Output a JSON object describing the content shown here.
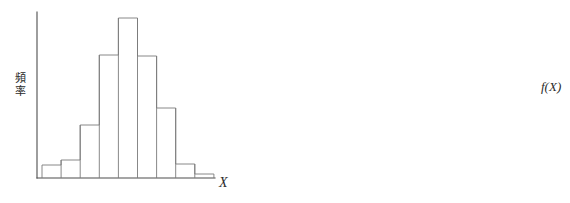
{
  "figure": {
    "title": "",
    "background_color": "#ffffff",
    "width": 570,
    "height": 203
  },
  "panels": [
    {
      "id": "left",
      "name": "sample-histogram",
      "y_axis_label": "頻\n率",
      "y_axis_label_chars": [
        "頻",
        "率"
      ],
      "x_axis_label": "X"
    },
    {
      "id": "right",
      "name": "density-histogram",
      "y_axis_label": "f(X)",
      "x_axis_label": "X"
    }
  ],
  "colors": {
    "axis": "#4d4d4d",
    "bar_stroke": "#7a7a7a",
    "bar_stroke_thin": "#8a8a8a",
    "curve": "#3d3d3d",
    "text": "#2b2b2b",
    "background": "#ffffff"
  },
  "chart_data": [
    {
      "type": "bar",
      "id": "left-histogram",
      "title": "",
      "xlabel": "X",
      "ylabel": "頻率",
      "grid": false,
      "legend": null,
      "axis_ranges": {
        "x": [
          0,
          1
        ],
        "y": [
          0,
          1
        ]
      },
      "note": "Sample frequency histogram, 9 class intervals, bell shaped",
      "categories": [
        "1",
        "2",
        "3",
        "4",
        "5",
        "6",
        "7",
        "8",
        "9"
      ],
      "values": [
        13,
        18,
        53,
        123,
        160,
        122,
        70,
        14,
        4
      ],
      "bar_geometry": {
        "baseline_y": 178,
        "axis_x": 37,
        "axis_top_y": 12,
        "axis_right_x": 215,
        "bar_left_x": 42,
        "bar_width": 19.1,
        "tops_y": [
          165,
          160,
          125,
          55,
          18,
          56,
          108,
          164,
          174
        ]
      }
    },
    {
      "type": "bar",
      "id": "right-histogram-with-density",
      "title": "",
      "xlabel": "X",
      "ylabel": "f(X)",
      "grid": false,
      "legend": null,
      "axis_ranges": {
        "x": [
          0,
          1
        ],
        "y": [
          0,
          1
        ]
      },
      "note": "Fine-binned relative frequency histogram converging to the normal density curve f(X)",
      "bin_count": 29,
      "values": [
        2,
        3,
        5,
        8,
        12,
        18,
        26,
        36,
        48,
        62,
        76,
        89,
        100,
        109,
        114,
        116,
        114,
        109,
        100,
        89,
        76,
        62,
        48,
        36,
        26,
        18,
        12,
        8,
        5
      ],
      "bar_geometry": {
        "baseline_y": 176,
        "axis_x": 294,
        "axis_top_y": 30,
        "axis_right_x": 537,
        "bar_left_x": 303,
        "bar_width": 7.9,
        "peak_y": 48,
        "peak_x": 421
      },
      "density_curve": {
        "type": "line",
        "name": "f(X)",
        "mean_x": 421,
        "sigma_x": 44,
        "peak_y": 48,
        "baseline_y": 176
      }
    }
  ]
}
